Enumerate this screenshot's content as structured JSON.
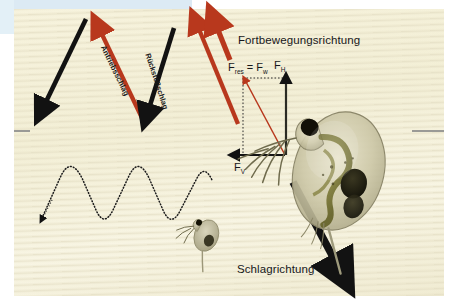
{
  "figure": {
    "background_color": "#f4f0d8",
    "accent_red": "#b8381d",
    "accent_black": "#121212",
    "page_margin_color": "#dceaf4"
  },
  "labels": {
    "direction_of_travel": "Fortbewegungsrichtung",
    "stroke_direction": "Schlagrichtung",
    "power_stroke": "Antriebsschlag",
    "recovery_stroke": "Rückstoßschlag"
  },
  "forces": {
    "resultant": {
      "symbol": "F",
      "sub": "res",
      "equals": "=",
      "symbol2": "F",
      "sub2": "w"
    },
    "horizontal": {
      "symbol": "F",
      "sub": "H"
    },
    "vertical": {
      "symbol": "F",
      "sub": "V"
    }
  },
  "organisms": [
    {
      "name": "daphnia-large",
      "note": "water flea, detailed, right side"
    },
    {
      "name": "daphnia-small",
      "note": "water flea, small, end of dotted path"
    }
  ],
  "paths": {
    "zigzag_strokes": "alternating red and black stroke arrows",
    "dotted_swim_track": "dotted sinusoidal swimming trajectory with arrowhead at left"
  }
}
